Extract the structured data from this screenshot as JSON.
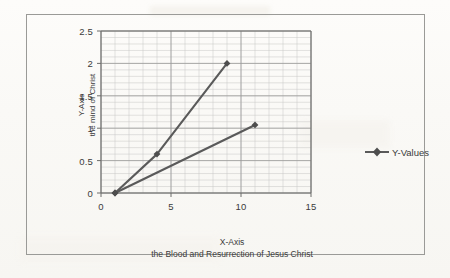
{
  "chart_data": {
    "type": "line",
    "title": "",
    "xlabel": "X-Axis",
    "xlabel_sub": "the Blood and Resurrection of Jesus Christ",
    "ylabel": "Y-Axis",
    "ylabel_sub": "the mind of Christ",
    "xlim": [
      0,
      15
    ],
    "ylim": [
      0,
      2.5
    ],
    "xticks": [
      "0",
      "5",
      "10",
      "15"
    ],
    "xtick_values": [
      0,
      5,
      10,
      15
    ],
    "yticks": [
      "0",
      "0.5",
      "1",
      "1.5",
      "2",
      "2.5"
    ],
    "ytick_values": [
      0,
      0.5,
      1,
      1.5,
      2,
      2.5
    ],
    "grid": "major and minor gridlines shown",
    "minor_x_step": 1,
    "minor_y_step": 0.1,
    "legend_position": "right",
    "legend": [
      "Y-Values"
    ],
    "marker": "diamond",
    "line_color": "#5a5a5a",
    "grid_color": "#b9b9b9",
    "series": [
      {
        "name": "Y-Values",
        "segment": "upper",
        "points": [
          {
            "x": 1,
            "y": 0
          },
          {
            "x": 4,
            "y": 0.6
          },
          {
            "x": 9,
            "y": 2.0
          }
        ]
      },
      {
        "name": "Y-Values",
        "segment": "lower",
        "points": [
          {
            "x": 1,
            "y": 0
          },
          {
            "x": 11,
            "y": 1.05
          }
        ]
      }
    ]
  },
  "axes": {
    "y_title_line1": "Y-Axis",
    "y_title_line2": "the mind of Christ",
    "x_title_line1": "X-Axis",
    "x_title_line2": "the Blood and Resurrection of Jesus Christ",
    "y_labels": [
      "2.5",
      "2",
      "1.5",
      "1",
      "0.5",
      "0"
    ],
    "x_labels": [
      "0",
      "5",
      "10",
      "15"
    ]
  },
  "legend": {
    "series_label": "Y-Values"
  }
}
